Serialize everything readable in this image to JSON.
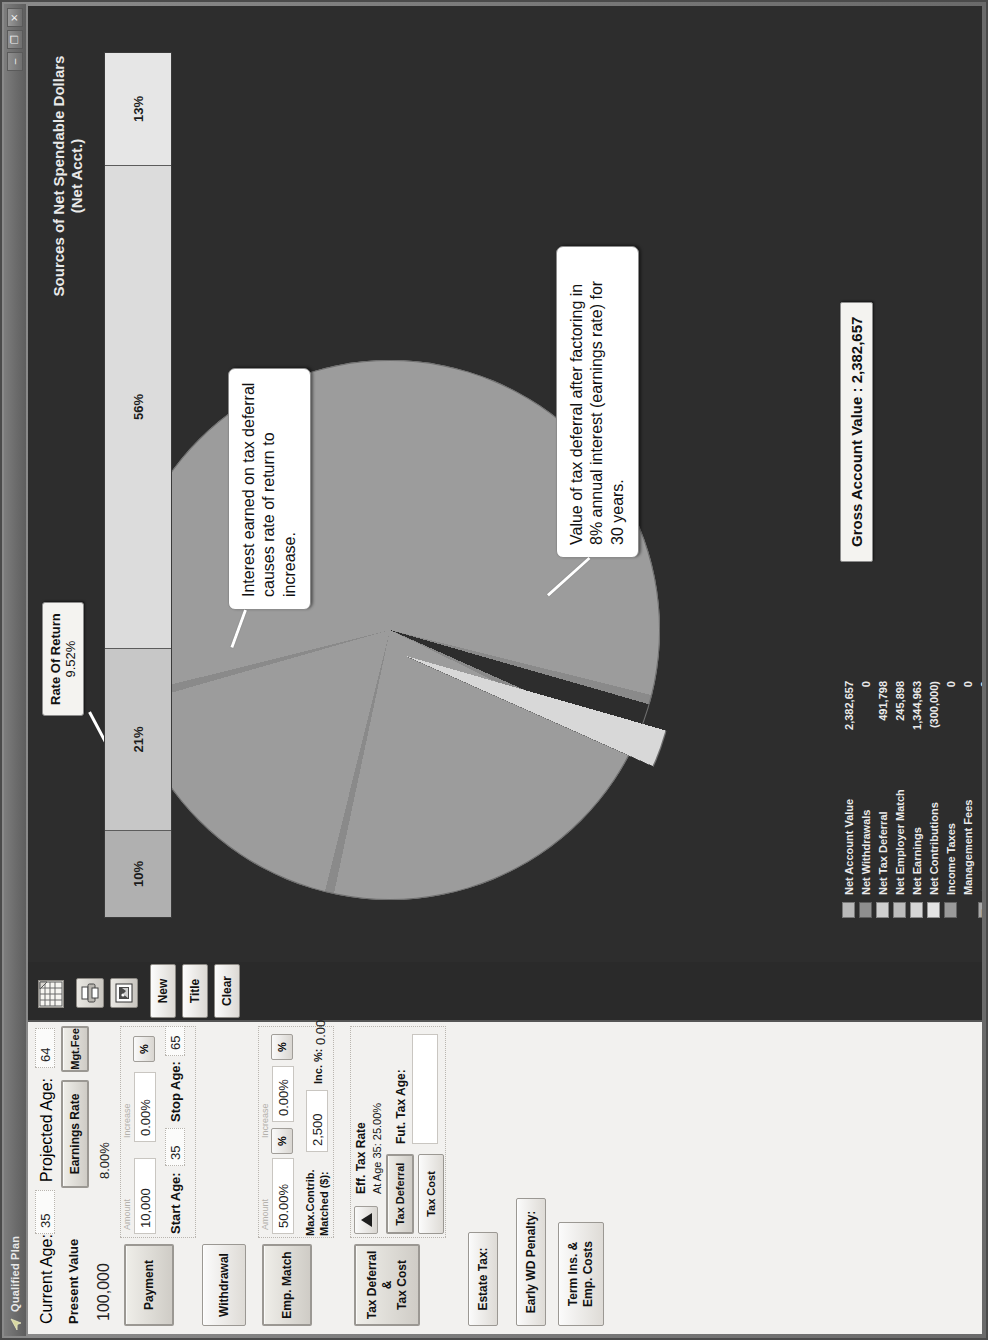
{
  "window": {
    "title": "Qualified Plan",
    "icon": "app-icon",
    "buttons": {
      "minimize": "–",
      "maximize": "❐",
      "close": "✕"
    }
  },
  "form": {
    "current_age_label": "Current Age:",
    "current_age_value": "35",
    "projected_age_label": "Projected Age:",
    "projected_age_value": "64",
    "present_value_label": "Present Value",
    "present_value_value": "100,000",
    "earnings_rate_button": "Earnings Rate",
    "earnings_rate_value": "8.00%",
    "mgt_fee_button": "Mgt.Fee",
    "payment": {
      "button": "Payment",
      "amount_caption": "Amount",
      "amount_value": "10,000",
      "increase_caption": "Increase",
      "increase_value": "0.00%",
      "percent_toggle": "%",
      "start_age_label": "Start Age:",
      "start_age_value": "35",
      "stop_age_label": "Stop Age:",
      "stop_age_value": "65"
    },
    "withdrawal_button": "Withdrawal",
    "emp_match": {
      "button": "Emp. Match",
      "amount_caption": "Amount",
      "amount_value": "50.00%",
      "percent_toggle": "%",
      "increase_caption": "Increase",
      "increase_value": "0.00%",
      "increase_percent_toggle": "%",
      "max_contrib_label": "Max.Contrib.",
      "matched_label": "Matched ($):",
      "matched_value": "2,500",
      "inc_pct_label": "Inc. %:",
      "inc_pct_value": "0.00%"
    },
    "tax_block": {
      "button_line1": "Tax Deferral &",
      "button_line2": "Tax Cost",
      "spinner_icon": "up-arrow-icon",
      "eff_tax_rate_label": "Eff. Tax Rate",
      "eff_tax_rate_value": "At Age 35: 25.00%",
      "tax_deferral_button": "Tax Deferral",
      "tax_cost_button": "Tax Cost",
      "fut_tax_age_label": "Fut. Tax Age:",
      "fut_tax_age_value": ""
    },
    "estate_tax_button": "Estate Tax:",
    "early_wd_penalty_button": "Early WD Penalty:",
    "term_ins_button_line1": "Term Ins. &",
    "term_ins_button_line2": "Emp. Costs"
  },
  "toolbar": {
    "grid_icon": "spreadsheet-icon",
    "print_icon": "print-icon",
    "image_icon": "picture-icon",
    "new_button": "New",
    "title_button": "Title",
    "clear_button": "Clear"
  },
  "callouts": [
    {
      "text": "Interest earned on tax deferral causes rate of return to increase."
    },
    {
      "text": "Value of tax deferral after factoring in 8% annual interest (earnings rate) for 30 years."
    }
  ],
  "rate_of_return": {
    "label": "Rate Of Return",
    "value": "9.52%"
  },
  "gross_account_value": "Gross Account Value : 2,382,657",
  "brand": "Truth Concepts",
  "legend": {
    "rows": [
      {
        "name": "Net Account Value",
        "value": "2,382,657",
        "color": "#b9b9b9"
      },
      {
        "name": "Net Withdrawals",
        "value": "0",
        "color": "#8f8f8f"
      },
      {
        "name": "Net Tax Deferral",
        "value": "491,798",
        "color": "#cfcfcf"
      },
      {
        "name": "Net Employer Match",
        "value": "245,898",
        "color": "#bdbdbd"
      },
      {
        "name": "Net Earnings",
        "value": "1,344,963",
        "color": "#d6d6d6"
      },
      {
        "name": "Net Contributions",
        "value": "(300,000)",
        "color": "#e4e4e4"
      },
      {
        "name": "Income Taxes",
        "value": "0",
        "color": "#9a9a9a"
      },
      {
        "name": "Management Fees",
        "value": "0",
        "color": "transparent"
      },
      {
        "name": "",
        "value": "0",
        "color": "#a8a8a8"
      },
      {
        "name": "Early WD Penalty",
        "value": "0",
        "color": "#8b8b8b"
      },
      {
        "name": "Estate Tax",
        "value": "0",
        "color": "#9e9e9e"
      }
    ]
  },
  "chart_data": [
    {
      "type": "pie",
      "title": "",
      "labels": [
        "Net Earnings",
        "Net Contributions",
        "Net Tax Deferral",
        "Net Employer Match"
      ],
      "values": [
        56,
        13,
        21,
        10
      ],
      "colors": [
        "#9c9c9c",
        "#d8d8d8",
        "#8d8d8d",
        "#8d8d8d"
      ],
      "exploded": [
        "Net Contributions"
      ]
    },
    {
      "type": "bar",
      "orientation": "horizontal-stacked",
      "title": "Sources of Net Spendable Dollars (Net Acct.)",
      "categories": [
        "Net Employer Match",
        "Net Tax Deferral",
        "Net Earnings",
        "Net Contributions"
      ],
      "values": [
        10,
        21,
        56,
        13
      ],
      "value_labels": [
        "10%",
        "21%",
        "56%",
        "13%"
      ],
      "colors": [
        "#b0b0b0",
        "#c7c7c7",
        "#dcdcdc",
        "#e6e6e6"
      ],
      "xlabel": "",
      "ylabel": "",
      "grid": false,
      "legend": "none"
    }
  ]
}
